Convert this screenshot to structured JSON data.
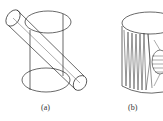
{
  "figure": {
    "panels": [
      {
        "id": "a",
        "label": "(a)",
        "description": "wireframe cylinder with diagonal cylinder passing through"
      },
      {
        "id": "b",
        "label": "(b)",
        "description": "triangulated mesh of cylinder with intersection"
      }
    ],
    "stroke_color": "#2a2a2a"
  }
}
